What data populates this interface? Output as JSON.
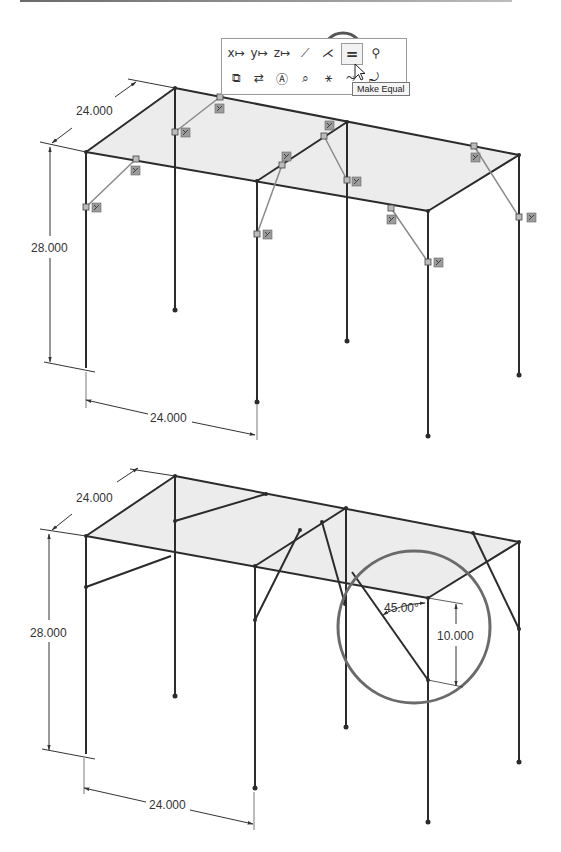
{
  "figure": {
    "top_view": {
      "dimensions": {
        "depth": "24.000",
        "height": "28.000",
        "width": "24.000"
      },
      "context_toolbar": {
        "row1": [
          {
            "icon": "coincident-x-icon",
            "glyph": "x↦"
          },
          {
            "icon": "coincident-y-icon",
            "glyph": "y↦"
          },
          {
            "icon": "coincident-z-icon",
            "glyph": "z↦"
          },
          {
            "icon": "collinear-line-icon",
            "glyph": "⟋"
          },
          {
            "icon": "perpendicular-icon",
            "glyph": "⋌"
          },
          {
            "icon": "equal-icon",
            "glyph": "=",
            "active": true
          },
          {
            "icon": "fix-icon",
            "glyph": "⚲"
          }
        ],
        "row2": [
          {
            "icon": "convert-entities-icon",
            "glyph": "⧉"
          },
          {
            "icon": "parallel-icon",
            "glyph": "⇄"
          },
          {
            "icon": "smart-dimension-icon",
            "glyph": "Ⓐ"
          },
          {
            "icon": "zoom-selection-icon",
            "glyph": "⌕"
          },
          {
            "icon": "relations-display-icon",
            "glyph": "⚹"
          },
          {
            "icon": "sketch-fillet-icon",
            "glyph": "⤳"
          },
          {
            "icon": "exit-sketch-icon",
            "glyph": "⤾"
          }
        ],
        "tooltip": "Make Equal"
      }
    },
    "bottom_view": {
      "dimensions": {
        "depth": "24.000",
        "height": "28.000",
        "width": "24.000",
        "angle": "45.00°",
        "brace_drop": "10.000"
      }
    },
    "colors": {
      "line": "#2b2b2b",
      "construction_line": "#8a8a8a",
      "top_fill": "#ececec",
      "highlight_circle": "#6a6a6a",
      "relation_badge": "#9c9c9c"
    }
  }
}
